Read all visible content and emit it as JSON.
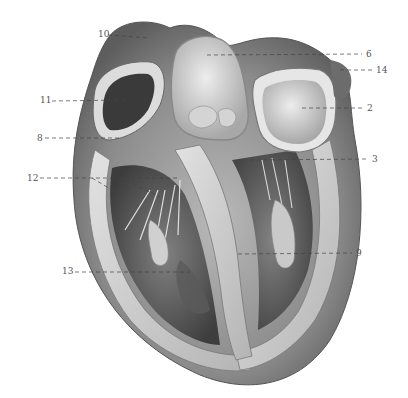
{
  "figure": {
    "labels": [
      {
        "id": "10",
        "text": "10",
        "x": 98,
        "y": 34,
        "side": "left",
        "target": [
          150,
          38
        ]
      },
      {
        "id": "6",
        "text": "6",
        "x": 367,
        "y": 54,
        "side": "right",
        "target": [
          207,
          55
        ]
      },
      {
        "id": "14",
        "text": "14",
        "x": 378,
        "y": 70,
        "side": "right",
        "target": [
          340,
          70
        ]
      },
      {
        "id": "11",
        "text": "11",
        "x": 40,
        "y": 100,
        "side": "left",
        "target": [
          125,
          100
        ]
      },
      {
        "id": "2",
        "text": "2",
        "x": 368,
        "y": 108,
        "side": "right",
        "target": [
          302,
          108
        ]
      },
      {
        "id": "8",
        "text": "8",
        "x": 37,
        "y": 138,
        "side": "left",
        "target": [
          120,
          138
        ]
      },
      {
        "id": "3",
        "text": "3",
        "x": 373,
        "y": 159,
        "side": "right",
        "target": [
          250,
          160
        ]
      },
      {
        "id": "12",
        "text": "12",
        "x": 28,
        "y": 178,
        "side": "left",
        "target": [
          178,
          178
        ]
      },
      {
        "id": "9",
        "text": "9",
        "x": 357,
        "y": 253,
        "side": "right",
        "target": [
          238,
          254
        ]
      },
      {
        "id": "13",
        "text": "13",
        "x": 63,
        "y": 271,
        "side": "left",
        "target": [
          190,
          272
        ]
      }
    ]
  }
}
